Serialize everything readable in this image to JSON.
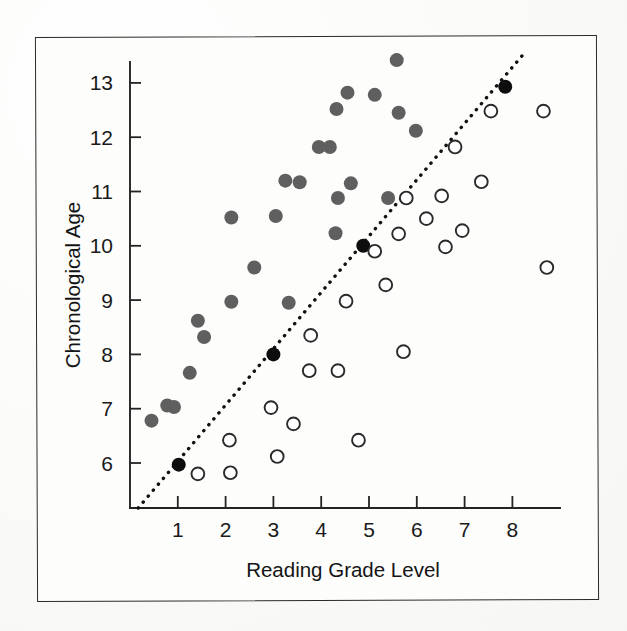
{
  "figure": {
    "frame_present": true,
    "background_color": "#fdfdfc",
    "border_color": "#2b2b2b"
  },
  "chart_data": {
    "type": "scatter",
    "title": "",
    "xlabel": "Reading Grade Level",
    "ylabel": "Chronological Age",
    "xlim": [
      0,
      9.3
    ],
    "ylim": [
      5.1,
      13.9
    ],
    "xticks": [
      1,
      2,
      3,
      4,
      5,
      6,
      7,
      8
    ],
    "yticks": [
      6,
      7,
      8,
      9,
      10,
      11,
      12,
      13
    ],
    "xtick_labels": [
      "1",
      "2",
      "3",
      "4",
      "5",
      "6",
      "7",
      "8"
    ],
    "ytick_labels": [
      "6",
      "7",
      "8",
      "9",
      "10",
      "11",
      "12",
      "13"
    ],
    "grid": false,
    "legend": null,
    "legend_position": "none",
    "annotations": [],
    "reference_line": {
      "name": "identity-trend-line",
      "style": "dotted",
      "color": "#111111",
      "x": [
        0.17,
        8.3
      ],
      "y": [
        5.17,
        13.6
      ]
    },
    "series": [
      {
        "name": "Above reference line (gray filled)",
        "marker": "filled-circle",
        "color": "#5f5f5f",
        "points": [
          [
            0.45,
            6.78
          ],
          [
            0.78,
            7.06
          ],
          [
            0.92,
            7.03
          ],
          [
            1.25,
            7.66
          ],
          [
            1.42,
            8.62
          ],
          [
            1.55,
            8.32
          ],
          [
            2.12,
            10.52
          ],
          [
            2.12,
            8.97
          ],
          [
            2.6,
            9.6
          ],
          [
            3.05,
            10.55
          ],
          [
            3.32,
            8.95
          ],
          [
            3.55,
            11.17
          ],
          [
            3.95,
            11.82
          ],
          [
            4.18,
            11.82
          ],
          [
            4.35,
            10.88
          ],
          [
            4.3,
            10.23
          ],
          [
            4.32,
            12.52
          ],
          [
            4.55,
            12.82
          ],
          [
            4.62,
            11.15
          ],
          [
            5.12,
            12.78
          ],
          [
            5.4,
            10.88
          ],
          [
            5.58,
            13.42
          ],
          [
            5.62,
            12.45
          ],
          [
            5.98,
            12.12
          ],
          [
            3.25,
            11.2
          ]
        ]
      },
      {
        "name": "On reference line (black filled)",
        "marker": "filled-circle",
        "color": "#0d0d0d",
        "points": [
          [
            1.02,
            5.97
          ],
          [
            3.0,
            8.0
          ],
          [
            4.88,
            10.0
          ],
          [
            7.85,
            12.93
          ]
        ]
      },
      {
        "name": "Below reference line (open circles)",
        "marker": "open-circle",
        "color": "#2a2a2a",
        "points": [
          [
            1.42,
            5.8
          ],
          [
            2.1,
            5.82
          ],
          [
            2.08,
            6.42
          ],
          [
            2.95,
            7.02
          ],
          [
            3.08,
            6.12
          ],
          [
            3.42,
            6.72
          ],
          [
            3.75,
            7.7
          ],
          [
            3.78,
            8.35
          ],
          [
            4.35,
            7.7
          ],
          [
            4.52,
            8.98
          ],
          [
            4.78,
            6.42
          ],
          [
            5.12,
            9.9
          ],
          [
            5.35,
            9.28
          ],
          [
            5.62,
            10.22
          ],
          [
            5.72,
            8.05
          ],
          [
            5.78,
            10.88
          ],
          [
            6.2,
            10.5
          ],
          [
            6.52,
            10.92
          ],
          [
            6.6,
            9.98
          ],
          [
            6.8,
            11.82
          ],
          [
            6.95,
            10.28
          ],
          [
            7.35,
            11.18
          ],
          [
            7.55,
            12.48
          ],
          [
            8.65,
            12.48
          ],
          [
            8.72,
            9.6
          ]
        ]
      }
    ]
  }
}
